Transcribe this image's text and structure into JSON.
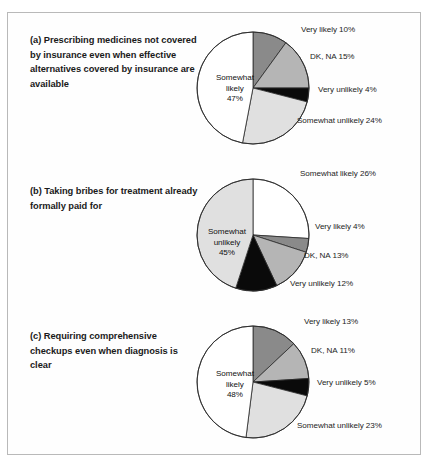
{
  "figure": {
    "background_color": "#fefefe",
    "border_color": "#b9b9b9"
  },
  "palette": {
    "very_likely": "#8a8a8a",
    "dk_na": "#b5b5b5",
    "very_unlikely": "#0a0a0a",
    "somewhat_unlikely": "#e0e0e0",
    "somewhat_likely": "#ffffff",
    "outline": "#2b2b2b"
  },
  "panels": [
    {
      "id": "a",
      "caption": "(a)  Prescribing medicines not covered by insurance even when effective alternatives covered by insurance are available",
      "inner_label": {
        "line1": "Somewhat",
        "line2": "likely",
        "line3": "47%"
      },
      "labels": [
        {
          "text": "Very likely 10%",
          "x": 107,
          "y": 6
        },
        {
          "text": "DK, NA 15%",
          "x": 116,
          "y": 33
        },
        {
          "text": "Very unlikely 4%",
          "x": 124,
          "y": 66
        },
        {
          "text": "Somewhat unlikely 24%",
          "x": 103,
          "y": 97
        }
      ]
    },
    {
      "id": "b",
      "caption": "(b)  Taking bribes for treatment already formally paid for",
      "inner_label": {
        "line1": "Somewhat",
        "line2": "unlikely",
        "line3": "45%"
      },
      "labels": [
        {
          "text": "Somewhat likely 26%",
          "x": 106,
          "y": 3
        },
        {
          "text": "Very likely 4%",
          "x": 121,
          "y": 56
        },
        {
          "text": "DK, NA 13%",
          "x": 110,
          "y": 85
        },
        {
          "text": "Very unlikely 12%",
          "x": 96,
          "y": 113
        }
      ]
    },
    {
      "id": "c",
      "caption": "(c) Requiring comprehensive checkups even when diagnosis is clear",
      "inner_label": {
        "line1": "Somewhat",
        "line2": "likely",
        "line3": "48%"
      },
      "labels": [
        {
          "text": "Very likely 13%",
          "x": 110,
          "y": 4
        },
        {
          "text": "DK, NA 11%",
          "x": 117,
          "y": 33
        },
        {
          "text": "Very unlikely 5%",
          "x": 123,
          "y": 65
        },
        {
          "text": "Somewhat unlikely 23%",
          "x": 103,
          "y": 108
        }
      ]
    }
  ],
  "chart_data": [
    {
      "type": "pie",
      "id": "a",
      "title": "(a)  Prescribing medicines not covered by insurance even when effective alternatives covered by insurance are available",
      "labels": [
        "Very likely",
        "DK, NA",
        "Very unlikely",
        "Somewhat unlikely",
        "Somewhat likely"
      ],
      "values": [
        10,
        15,
        4,
        24,
        47
      ],
      "unit": "percent",
      "colors": [
        "#8a8a8a",
        "#b5b5b5",
        "#0a0a0a",
        "#e0e0e0",
        "#ffffff"
      ],
      "start_angle_deg": 0,
      "direction": "clockwise",
      "legend": "labels-outside"
    },
    {
      "type": "pie",
      "id": "b",
      "title": "(b)  Taking bribes for treatment already formally paid for",
      "labels": [
        "Somewhat likely",
        "Very likely",
        "DK, NA",
        "Very unlikely",
        "Somewhat unlikely"
      ],
      "values": [
        26,
        4,
        13,
        12,
        45
      ],
      "unit": "percent",
      "colors": [
        "#ffffff",
        "#8a8a8a",
        "#b5b5b5",
        "#0a0a0a",
        "#e0e0e0"
      ],
      "start_angle_deg": 0,
      "direction": "clockwise",
      "legend": "labels-outside"
    },
    {
      "type": "pie",
      "id": "c",
      "title": "(c) Requiring comprehensive checkups even when diagnosis is clear",
      "labels": [
        "Very likely",
        "DK, NA",
        "Very unlikely",
        "Somewhat unlikely",
        "Somewhat likely"
      ],
      "values": [
        13,
        11,
        5,
        23,
        48
      ],
      "unit": "percent",
      "colors": [
        "#8a8a8a",
        "#b5b5b5",
        "#0a0a0a",
        "#e0e0e0",
        "#ffffff"
      ],
      "start_angle_deg": 0,
      "direction": "clockwise",
      "legend": "labels-outside"
    }
  ]
}
